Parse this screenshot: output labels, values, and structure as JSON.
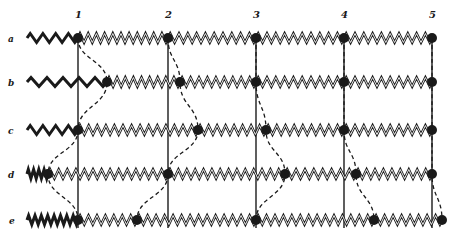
{
  "figure": {
    "colors": {
      "ink": "#1a1a1a",
      "paper": "#ffffff"
    }
  },
  "columns": [
    {
      "label": "1",
      "x": 78
    },
    {
      "label": "2",
      "x": 168
    },
    {
      "label": "3",
      "x": 256
    },
    {
      "label": "4",
      "x": 344
    },
    {
      "label": "5",
      "x": 432
    }
  ],
  "rows": [
    {
      "label": "a",
      "y": 38,
      "lead_start": 27,
      "dots": [
        78,
        168,
        256,
        344,
        432
      ],
      "lead_waves": 4
    },
    {
      "label": "b",
      "y": 82,
      "lead_start": 27,
      "dots": [
        107,
        180,
        256,
        344,
        432
      ],
      "lead_waves": 5
    },
    {
      "label": "c",
      "y": 130,
      "lead_start": 27,
      "dots": [
        78,
        198,
        266,
        344,
        432
      ],
      "lead_waves": 4
    },
    {
      "label": "d",
      "y": 174,
      "lead_start": 27,
      "dots": [
        48,
        168,
        285,
        356,
        432
      ],
      "lead_waves": 4
    },
    {
      "label": "e",
      "y": 220,
      "lead_start": 27,
      "dots": [
        78,
        137,
        256,
        374,
        442
      ],
      "lead_waves": 8
    }
  ],
  "spring": {
    "coils_per_segment": 10,
    "amplitude": 9
  },
  "vertical_lines": {
    "top": 36,
    "bottom": 228
  }
}
